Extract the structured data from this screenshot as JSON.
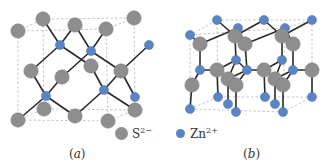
{
  "figure": {
    "panels": [
      {
        "id": "a",
        "caption": "a",
        "structure": "zinc blende (cubic)",
        "box": {
          "front": [
            [
              18,
              31
            ],
            [
              106,
              29
            ],
            [
              108,
              121
            ],
            [
              18,
              120
            ]
          ],
          "back": [
            [
              43,
              19
            ],
            [
              134,
              18
            ],
            [
              135,
              110
            ],
            [
              44,
              109
            ]
          ]
        },
        "atoms": [
          {
            "el": "S",
            "x": 18,
            "y": 31
          },
          {
            "el": "S",
            "x": 43,
            "y": 19
          },
          {
            "el": "S",
            "x": 75,
            "y": 25
          },
          {
            "el": "S",
            "x": 106,
            "y": 29
          },
          {
            "el": "S",
            "x": 134,
            "y": 18
          },
          {
            "el": "S",
            "x": 31,
            "y": 71
          },
          {
            "el": "S",
            "x": 62,
            "y": 77
          },
          {
            "el": "S",
            "x": 91,
            "y": 66
          },
          {
            "el": "S",
            "x": 121,
            "y": 71
          },
          {
            "el": "S",
            "x": 44,
            "y": 109
          },
          {
            "el": "S",
            "x": 75,
            "y": 116
          },
          {
            "el": "S",
            "x": 108,
            "y": 121
          },
          {
            "el": "S",
            "x": 135,
            "y": 110
          },
          {
            "el": "S",
            "x": 18,
            "y": 120
          },
          {
            "el": "Zn",
            "x": 60,
            "y": 45
          },
          {
            "el": "Zn",
            "x": 91,
            "y": 51
          },
          {
            "el": "Zn",
            "x": 149,
            "y": 45
          },
          {
            "el": "Zn",
            "x": 46,
            "y": 96
          },
          {
            "el": "Zn",
            "x": 104,
            "y": 90
          },
          {
            "el": "Zn",
            "x": 135,
            "y": 97
          }
        ],
        "bonds": [
          [
            43,
            19,
            60,
            45
          ],
          [
            75,
            25,
            60,
            45
          ],
          [
            60,
            45,
            31,
            71
          ],
          [
            60,
            45,
            91,
            66
          ],
          [
            75,
            25,
            91,
            51
          ],
          [
            106,
            29,
            91,
            51
          ],
          [
            91,
            51,
            62,
            77
          ],
          [
            91,
            51,
            121,
            71
          ],
          [
            121,
            71,
            149,
            45
          ],
          [
            121,
            71,
            135,
            97
          ],
          [
            121,
            71,
            104,
            90
          ],
          [
            31,
            71,
            46,
            96
          ],
          [
            62,
            77,
            46,
            96
          ],
          [
            46,
            96,
            18,
            120
          ],
          [
            46,
            96,
            75,
            116
          ],
          [
            91,
            66,
            104,
            90
          ],
          [
            104,
            90,
            75,
            116
          ],
          [
            104,
            90,
            135,
            110
          ]
        ]
      },
      {
        "id": "b",
        "caption": "b",
        "structure": "wurtzite (hexagonal)",
        "box": {
          "front": [
            [
              190,
              35
            ],
            [
              285,
              28
            ],
            [
              283,
              112
            ],
            [
              190,
              109
            ]
          ],
          "back": [
            [
              217,
              20
            ],
            [
              312,
              20
            ],
            [
              312,
              97
            ],
            [
              218,
              97
            ]
          ]
        },
        "atoms": [
          {
            "el": "Zn",
            "x": 217,
            "y": 20
          },
          {
            "el": "Zn",
            "x": 264,
            "y": 20
          },
          {
            "el": "Zn",
            "x": 312,
            "y": 20
          },
          {
            "el": "Zn",
            "x": 190,
            "y": 35
          },
          {
            "el": "Zn",
            "x": 238,
            "y": 28
          },
          {
            "el": "Zn",
            "x": 285,
            "y": 28
          },
          {
            "el": "S",
            "x": 200,
            "y": 44
          },
          {
            "el": "S",
            "x": 245,
            "y": 44
          },
          {
            "el": "S",
            "x": 293,
            "y": 44
          },
          {
            "el": "S",
            "x": 235,
            "y": 36
          },
          {
            "el": "S",
            "x": 282,
            "y": 36
          },
          {
            "el": "Zn",
            "x": 236,
            "y": 60
          },
          {
            "el": "Zn",
            "x": 282,
            "y": 60
          },
          {
            "el": "Zn",
            "x": 200,
            "y": 70
          },
          {
            "el": "Zn",
            "x": 247,
            "y": 70
          },
          {
            "el": "Zn",
            "x": 293,
            "y": 70
          },
          {
            "el": "S",
            "x": 217,
            "y": 70
          },
          {
            "el": "S",
            "x": 264,
            "y": 70
          },
          {
            "el": "S",
            "x": 312,
            "y": 70
          },
          {
            "el": "S",
            "x": 228,
            "y": 79
          },
          {
            "el": "S",
            "x": 275,
            "y": 79
          },
          {
            "el": "S",
            "x": 192,
            "y": 85
          },
          {
            "el": "S",
            "x": 236,
            "y": 85
          },
          {
            "el": "S",
            "x": 283,
            "y": 85
          },
          {
            "el": "Zn",
            "x": 218,
            "y": 97
          },
          {
            "el": "Zn",
            "x": 265,
            "y": 97
          },
          {
            "el": "Zn",
            "x": 312,
            "y": 97
          },
          {
            "el": "Zn",
            "x": 228,
            "y": 104
          },
          {
            "el": "Zn",
            "x": 275,
            "y": 104
          },
          {
            "el": "Zn",
            "x": 190,
            "y": 109
          },
          {
            "el": "Zn",
            "x": 236,
            "y": 112
          },
          {
            "el": "Zn",
            "x": 283,
            "y": 112
          }
        ],
        "bonds": [
          [
            190,
            35,
            200,
            44
          ],
          [
            200,
            44,
            238,
            28
          ],
          [
            200,
            44,
            200,
            70
          ],
          [
            238,
            28,
            245,
            44
          ],
          [
            245,
            44,
            285,
            28
          ],
          [
            245,
            44,
            247,
            70
          ],
          [
            217,
            20,
            235,
            36
          ],
          [
            235,
            36,
            264,
            20
          ],
          [
            235,
            36,
            236,
            60
          ],
          [
            264,
            20,
            282,
            36
          ],
          [
            282,
            36,
            312,
            20
          ],
          [
            282,
            36,
            282,
            60
          ],
          [
            285,
            28,
            293,
            44
          ],
          [
            293,
            44,
            293,
            70
          ],
          [
            200,
            70,
            217,
            70
          ],
          [
            217,
            70,
            236,
            60
          ],
          [
            217,
            70,
            218,
            97
          ],
          [
            247,
            70,
            264,
            70
          ],
          [
            264,
            70,
            282,
            60
          ],
          [
            264,
            70,
            265,
            97
          ],
          [
            293,
            70,
            312,
            70
          ],
          [
            312,
            70,
            312,
            97
          ],
          [
            200,
            70,
            192,
            85
          ],
          [
            192,
            85,
            190,
            109
          ],
          [
            236,
            60,
            228,
            79
          ],
          [
            228,
            79,
            247,
            70
          ],
          [
            228,
            79,
            228,
            104
          ],
          [
            282,
            60,
            275,
            79
          ],
          [
            275,
            79,
            293,
            70
          ],
          [
            275,
            79,
            275,
            104
          ],
          [
            247,
            70,
            236,
            85
          ],
          [
            236,
            85,
            236,
            112
          ],
          [
            293,
            70,
            283,
            85
          ],
          [
            283,
            85,
            283,
            112
          ],
          [
            236,
            60,
            247,
            70
          ]
        ]
      }
    ],
    "legend": {
      "items": [
        {
          "symbol": "S",
          "charge": "2−",
          "color": "#8e8e8e"
        },
        {
          "symbol": "Zn",
          "charge": "2+",
          "color": "#5b84c4"
        }
      ]
    },
    "captions": {
      "a": "a",
      "b": "b"
    },
    "colors": {
      "sulfur": "#8e8e8e",
      "zinc": "#5b84c4",
      "bond": "#2a2a2a",
      "box": "#b9b9b9"
    }
  }
}
